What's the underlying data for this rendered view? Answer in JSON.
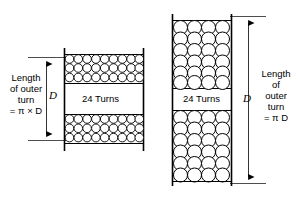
{
  "figure": {
    "background_color": "#ffffff",
    "line_color": "#000000",
    "circle_fill": "#ffffff"
  },
  "left_figure": {
    "caption_lines": [
      "Length",
      "of outer",
      "turn",
      "= π × D"
    ],
    "dimension_letter": "D",
    "turns_label": "24 Turns",
    "coil": {
      "columns": 10,
      "rows_top": 3,
      "rows_bottom": 3,
      "circle_diameter_px": 8
    }
  },
  "right_figure": {
    "caption_lines": [
      "Length",
      "of",
      "outer",
      "turn",
      "= π D"
    ],
    "dimension_letter": "D",
    "turns_label": "24 Turns",
    "coil": {
      "columns": 4,
      "rows_top": 6,
      "rows_bottom": 6,
      "circle_diameter_px": 14
    }
  }
}
